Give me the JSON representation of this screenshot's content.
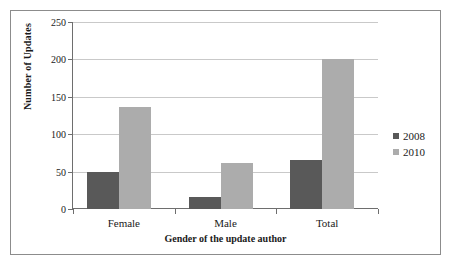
{
  "chart_data": {
    "type": "bar",
    "title": "",
    "xlabel": "Gender of the update author",
    "ylabel": "Number of Updates",
    "categories": [
      "Female",
      "Male",
      "Total"
    ],
    "series": [
      {
        "name": "2008",
        "color": "#595959",
        "values": [
          50,
          16,
          66
        ]
      },
      {
        "name": "2010",
        "color": "#acacac",
        "values": [
          137,
          62,
          200
        ]
      }
    ],
    "ylim": [
      0,
      250
    ],
    "yticks": [
      0,
      50,
      100,
      150,
      200,
      250
    ],
    "ytick_labels": [
      "0",
      "50",
      "100",
      "150",
      "200",
      "250"
    ],
    "grid": true,
    "legend_position": "right"
  },
  "legend": {
    "entries": [
      {
        "label": "2008"
      },
      {
        "label": "2010"
      }
    ]
  }
}
